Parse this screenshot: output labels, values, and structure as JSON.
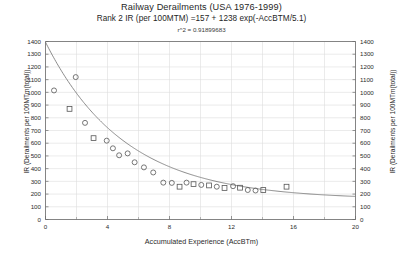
{
  "chart_data": {
    "type": "scatter",
    "title": "Railway Derailments (USA 1976-1999)",
    "subtitle": "Rank 2 IR (per 100MTM) =157 + 1238 exp(-AccBTM/5.1)",
    "r2_label": "r^2 = 0.91899683",
    "r2_value": 0.91899683,
    "xlabel": "Accumulated Experience (AccBTm)",
    "ylabel": "IR (Derailments per 100MTm(total))",
    "ylabel_right": "IR (Derailments per 100MTm(total))",
    "xlim": [
      0,
      20
    ],
    "ylim": [
      0,
      1400
    ],
    "xticks": [
      0,
      4,
      8,
      12,
      16,
      20
    ],
    "xticks_minor": [
      2,
      6,
      10,
      14,
      18
    ],
    "yticks": [
      0,
      100,
      200,
      300,
      400,
      500,
      600,
      700,
      800,
      900,
      1000,
      1100,
      1200,
      1300,
      1400
    ],
    "grid": true,
    "legend": "none",
    "series": [
      {
        "name": "Observed IR",
        "marker": "open-circle-square",
        "color": "#555555",
        "points": [
          {
            "x": 0.55,
            "y": 1015,
            "marker": "circle"
          },
          {
            "x": 1.55,
            "y": 870,
            "marker": "square"
          },
          {
            "x": 1.95,
            "y": 1120,
            "marker": "circle"
          },
          {
            "x": 2.55,
            "y": 760,
            "marker": "circle"
          },
          {
            "x": 3.1,
            "y": 640,
            "marker": "square"
          },
          {
            "x": 3.95,
            "y": 620,
            "marker": "circle"
          },
          {
            "x": 4.35,
            "y": 560,
            "marker": "circle"
          },
          {
            "x": 4.75,
            "y": 505,
            "marker": "circle"
          },
          {
            "x": 5.3,
            "y": 520,
            "marker": "circle"
          },
          {
            "x": 5.75,
            "y": 450,
            "marker": "circle"
          },
          {
            "x": 6.35,
            "y": 410,
            "marker": "circle"
          },
          {
            "x": 6.95,
            "y": 370,
            "marker": "circle"
          },
          {
            "x": 7.6,
            "y": 290,
            "marker": "circle"
          },
          {
            "x": 8.15,
            "y": 288,
            "marker": "circle"
          },
          {
            "x": 8.65,
            "y": 258,
            "marker": "square"
          },
          {
            "x": 9.1,
            "y": 290,
            "marker": "circle"
          },
          {
            "x": 9.55,
            "y": 278,
            "marker": "square"
          },
          {
            "x": 10.05,
            "y": 272,
            "marker": "circle"
          },
          {
            "x": 10.55,
            "y": 268,
            "marker": "square"
          },
          {
            "x": 11.05,
            "y": 258,
            "marker": "circle"
          },
          {
            "x": 11.55,
            "y": 248,
            "marker": "square"
          },
          {
            "x": 12.1,
            "y": 262,
            "marker": "circle"
          },
          {
            "x": 12.55,
            "y": 250,
            "marker": "square"
          },
          {
            "x": 13.05,
            "y": 232,
            "marker": "circle"
          },
          {
            "x": 13.55,
            "y": 228,
            "marker": "circle"
          },
          {
            "x": 14.05,
            "y": 232,
            "marker": "square"
          },
          {
            "x": 15.55,
            "y": 258,
            "marker": "square"
          }
        ]
      }
    ],
    "fit_curve": {
      "name": "Rank 2 IR fit",
      "equation": "IR = 157 + 1238 * exp(-AccBTM / 5.1)",
      "intercept": 157,
      "amplitude": 1238,
      "decay": 5.1,
      "color": "#777777"
    }
  }
}
